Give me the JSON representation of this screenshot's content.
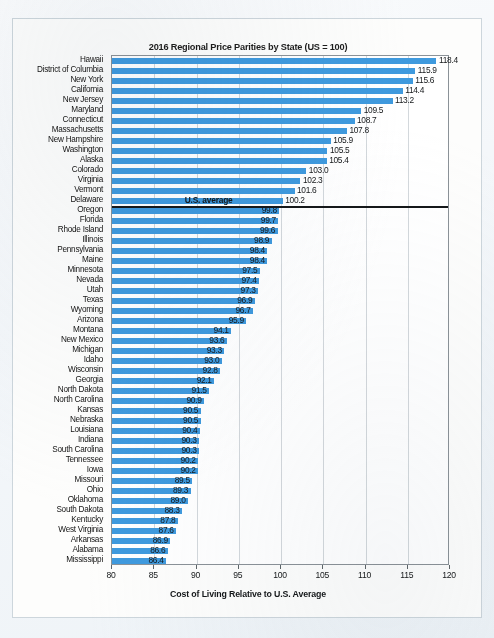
{
  "figure": {
    "title": "2016 Regional Price Parities by State (US = 100)",
    "xlabel": "Cost of Living Relative to U.S. Average",
    "annotation": "U.S. average",
    "bar_color": "#3f9ade",
    "axis_color": "#8b9298",
    "grid_color": "#d3d8dc"
  },
  "chart_data": {
    "type": "bar",
    "orientation": "horizontal",
    "title": "2016 Regional Price Parities by State (US = 100)",
    "xlabel": "Cost of Living Relative to U.S. Average",
    "ylabel": "",
    "xlim": [
      80,
      120
    ],
    "xticks": [
      80,
      85,
      90,
      95,
      100,
      105,
      110,
      115,
      120
    ],
    "grid": true,
    "legend": null,
    "reference_line": {
      "value": 100.0,
      "label": "U.S. average"
    },
    "categories": [
      "Hawaii",
      "District of Columbia",
      "New York",
      "California",
      "New Jersey",
      "Maryland",
      "Connecticut",
      "Massachusetts",
      "New Hampshire",
      "Washington",
      "Alaska",
      "Colorado",
      "Virginia",
      "Vermont",
      "Delaware",
      "Oregon",
      "Florida",
      "Rhode Island",
      "Illinois",
      "Pennsylvania",
      "Maine",
      "Minnesota",
      "Nevada",
      "Utah",
      "Texas",
      "Wyoming",
      "Arizona",
      "Montana",
      "New Mexico",
      "Michigan",
      "Idaho",
      "Wisconsin",
      "Georgia",
      "North Dakota",
      "North Carolina",
      "Kansas",
      "Nebraska",
      "Louisiana",
      "Indiana",
      "South Carolina",
      "Tennessee",
      "Iowa",
      "Missouri",
      "Ohio",
      "Oklahoma",
      "South Dakota",
      "Kentucky",
      "West Virginia",
      "Arkansas",
      "Alabama",
      "Mississippi"
    ],
    "values": [
      118.4,
      115.9,
      115.6,
      114.4,
      113.2,
      109.5,
      108.7,
      107.8,
      105.9,
      105.5,
      105.4,
      103.0,
      102.3,
      101.6,
      100.2,
      99.8,
      99.7,
      99.6,
      98.9,
      98.4,
      98.4,
      97.5,
      97.4,
      97.3,
      96.9,
      96.7,
      95.9,
      94.1,
      93.6,
      93.3,
      93.0,
      92.8,
      92.1,
      91.5,
      90.9,
      90.5,
      90.5,
      90.4,
      90.3,
      90.3,
      90.2,
      90.2,
      89.5,
      89.3,
      89.0,
      88.3,
      87.8,
      87.6,
      86.9,
      86.6,
      86.4
    ],
    "value_labels": [
      "118.4",
      "115.9",
      "115.6",
      "114.4",
      "113.2",
      "109.5",
      "108.7",
      "107.8",
      "105.9",
      "105.5",
      "105.4",
      "103.0",
      "102.3",
      "101.6",
      "100.2",
      "99.8",
      "99.7",
      "99.6",
      "98.9",
      "98.4",
      "98.4",
      "97.5",
      "97.4",
      "97.3",
      "96.9",
      "96.7",
      "95.9",
      "94.1",
      "93.6",
      "93.3",
      "93.0",
      "92.8",
      "92.1",
      "91.5",
      "90.9",
      "90.5",
      "90.5",
      "90.4",
      "90.3",
      "90.3",
      "90.2",
      "90.2",
      "89.5",
      "89.3",
      "89.0",
      "88.3",
      "87.8",
      "87.6",
      "86.9",
      "86.6",
      "86.4"
    ]
  }
}
